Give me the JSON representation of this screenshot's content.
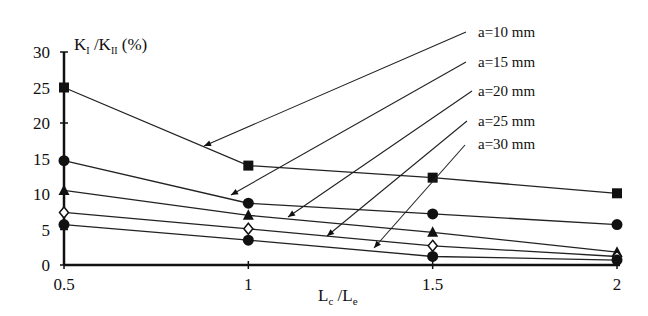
{
  "chart_data": {
    "type": "line",
    "title": "",
    "ylabel": "K_I / K_II (%)",
    "ylabel_parts": {
      "main1": "K",
      "sub1": "I",
      "sep": " /K",
      "sub2": "II",
      "tail": " (%)"
    },
    "xlabel": "L_c / L_e",
    "xlabel_parts": {
      "main1": "L",
      "sub1": "c",
      "sep": " /L",
      "sub2": "e"
    },
    "x": [
      0.5,
      1,
      1.5,
      2
    ],
    "x_tick_labels": [
      "0.5",
      "1",
      "1.5",
      "2"
    ],
    "y_ticks": [
      0,
      5,
      10,
      15,
      20,
      25,
      30
    ],
    "y_tick_labels": [
      "0",
      "5",
      "10",
      "15",
      "20",
      "25",
      "30"
    ],
    "xlim": [
      0.5,
      2
    ],
    "ylim": [
      0,
      30
    ],
    "grid": false,
    "legend_position": "upper right, annotated with arrows",
    "series": [
      {
        "name": "a=10 mm",
        "marker": "filled-square",
        "values": [
          25,
          14,
          12.3,
          10.1
        ]
      },
      {
        "name": "a=15 mm",
        "marker": "filled-circle",
        "values": [
          14.7,
          8.7,
          7.2,
          5.7
        ]
      },
      {
        "name": "a=20 mm",
        "marker": "filled-triangle",
        "values": [
          10.5,
          7.0,
          4.6,
          1.8
        ]
      },
      {
        "name": "a=25 mm",
        "marker": "open-diamond",
        "values": [
          7.4,
          5.1,
          2.7,
          1.2
        ]
      },
      {
        "name": "a=30 mm",
        "marker": "filled-circle",
        "values": [
          5.7,
          3.5,
          1.2,
          0.7
        ]
      }
    ]
  },
  "annotations": [
    {
      "label": "a=10 mm",
      "text_x": 478,
      "text_y": 37,
      "line_from": [
        466,
        32
      ],
      "arrow_to": [
        204,
        146
      ]
    },
    {
      "label": "a=15 mm",
      "text_x": 478,
      "text_y": 67,
      "line_from": [
        466,
        62
      ],
      "arrow_to": [
        231,
        195
      ]
    },
    {
      "label": "a=20 mm",
      "text_x": 478,
      "text_y": 96,
      "line_from": [
        472,
        91
      ],
      "arrow_to": [
        288,
        217
      ]
    },
    {
      "label": "a=25 mm",
      "text_x": 478,
      "text_y": 126,
      "line_from": [
        467,
        121
      ],
      "arrow_to": [
        327,
        236
      ]
    },
    {
      "label": "a=30 mm",
      "text_x": 478,
      "text_y": 149,
      "line_from": [
        465,
        145
      ],
      "arrow_to": [
        374,
        248
      ]
    }
  ]
}
